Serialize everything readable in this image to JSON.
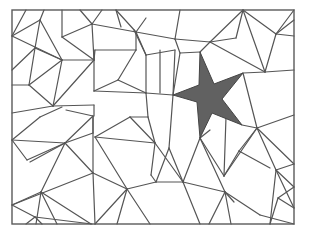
{
  "figure": {
    "title": "",
    "colors": {
      "background": "#ffffff",
      "line": "#555555",
      "star_fill": "#616161"
    },
    "frame": {
      "x": 12,
      "y": 10,
      "width": 282,
      "height": 214
    },
    "star": {
      "points": "200,52 214,84 243,73 222,99 242,125 212,113 200,138 197,102 173,95 199,85"
    },
    "edges": [
      [
        12,
        36,
        26,
        10
      ],
      [
        12,
        36,
        40,
        20
      ],
      [
        40,
        20,
        44,
        10
      ],
      [
        40,
        20,
        62,
        60
      ],
      [
        12,
        36,
        62,
        60
      ],
      [
        40,
        20,
        35,
        48
      ],
      [
        35,
        48,
        12,
        70
      ],
      [
        35,
        48,
        29,
        85
      ],
      [
        35,
        48,
        62,
        60
      ],
      [
        62,
        60,
        29,
        85
      ],
      [
        62,
        60,
        53,
        106
      ],
      [
        62,
        60,
        94,
        60
      ],
      [
        29,
        85,
        12,
        85
      ],
      [
        29,
        85,
        53,
        106
      ],
      [
        62,
        10,
        62,
        37
      ],
      [
        62,
        37,
        94,
        60
      ],
      [
        62,
        37,
        92,
        24
      ],
      [
        92,
        24,
        80,
        10
      ],
      [
        92,
        24,
        102,
        10
      ],
      [
        92,
        24,
        136,
        32
      ],
      [
        92,
        24,
        94,
        60
      ],
      [
        94,
        60,
        95,
        50
      ],
      [
        95,
        50,
        136,
        50
      ],
      [
        94,
        50,
        94,
        91
      ],
      [
        94,
        60,
        53,
        106
      ],
      [
        12,
        113,
        53,
        106
      ],
      [
        53,
        106,
        94,
        105
      ],
      [
        94,
        91,
        118,
        80
      ],
      [
        118,
        80,
        136,
        50
      ],
      [
        118,
        80,
        146,
        93
      ],
      [
        94,
        91,
        146,
        93
      ],
      [
        136,
        32,
        146,
        18
      ],
      [
        136,
        32,
        116,
        10
      ],
      [
        136,
        32,
        136,
        50
      ],
      [
        136,
        32,
        146,
        55
      ],
      [
        116,
        10,
        121,
        27
      ],
      [
        146,
        55,
        146,
        93
      ],
      [
        146,
        55,
        175,
        50
      ],
      [
        146,
        55,
        134,
        30
      ],
      [
        136,
        32,
        175,
        39
      ],
      [
        175,
        39,
        180,
        10
      ],
      [
        175,
        39,
        180,
        53
      ],
      [
        175,
        39,
        210,
        42
      ],
      [
        210,
        42,
        243,
        10
      ],
      [
        210,
        42,
        200,
        52
      ],
      [
        243,
        10,
        276,
        34
      ],
      [
        243,
        10,
        265,
        72
      ],
      [
        243,
        10,
        236,
        38
      ],
      [
        236,
        38,
        210,
        42
      ],
      [
        276,
        34,
        294,
        36
      ],
      [
        276,
        34,
        294,
        20
      ],
      [
        276,
        34,
        265,
        72
      ],
      [
        276,
        34,
        294,
        10
      ],
      [
        265,
        72,
        294,
        70
      ],
      [
        210,
        42,
        265,
        72
      ],
      [
        180,
        53,
        200,
        52
      ],
      [
        180,
        53,
        173,
        95
      ],
      [
        175,
        50,
        173,
        95
      ],
      [
        146,
        93,
        173,
        95
      ],
      [
        160,
        50,
        160,
        93
      ],
      [
        146,
        93,
        148,
        117
      ],
      [
        173,
        95,
        169,
        148
      ],
      [
        243,
        73,
        265,
        72
      ],
      [
        243,
        73,
        257,
        128
      ],
      [
        257,
        128,
        294,
        115
      ],
      [
        257,
        128,
        276,
        170
      ],
      [
        242,
        125,
        257,
        128
      ],
      [
        257,
        128,
        294,
        164
      ],
      [
        276,
        170,
        294,
        164
      ],
      [
        276,
        170,
        294,
        187
      ],
      [
        276,
        170,
        270,
        224
      ],
      [
        276,
        170,
        294,
        208
      ],
      [
        294,
        187,
        278,
        198
      ],
      [
        278,
        198,
        270,
        224
      ],
      [
        294,
        208,
        278,
        198
      ],
      [
        12,
        140,
        27,
        160
      ],
      [
        12,
        140,
        65,
        143
      ],
      [
        27,
        160,
        65,
        143
      ],
      [
        65,
        143,
        93,
        133
      ],
      [
        65,
        143,
        30,
        162
      ],
      [
        65,
        143,
        41,
        192
      ],
      [
        12,
        140,
        40,
        117
      ],
      [
        40,
        117,
        62,
        107
      ],
      [
        65,
        143,
        93,
        116
      ],
      [
        93,
        116,
        93,
        173
      ],
      [
        93,
        133,
        93,
        116
      ],
      [
        94,
        105,
        94,
        116
      ],
      [
        93,
        116,
        66,
        110
      ],
      [
        93,
        173,
        65,
        143
      ],
      [
        93,
        173,
        12,
        205
      ],
      [
        41,
        192,
        12,
        205
      ],
      [
        41,
        192,
        57,
        224
      ],
      [
        41,
        192,
        36,
        224
      ],
      [
        41,
        192,
        91,
        224
      ],
      [
        12,
        205,
        35,
        217
      ],
      [
        35,
        217,
        26,
        224
      ],
      [
        35,
        217,
        92,
        224
      ],
      [
        35,
        217,
        42,
        224
      ],
      [
        93,
        173,
        127,
        189
      ],
      [
        93,
        173,
        95,
        224
      ],
      [
        127,
        189,
        95,
        137
      ],
      [
        95,
        137,
        130,
        117
      ],
      [
        130,
        117,
        155,
        143
      ],
      [
        95,
        137,
        155,
        143
      ],
      [
        130,
        117,
        148,
        117
      ],
      [
        148,
        117,
        155,
        143
      ],
      [
        155,
        143,
        151,
        175
      ],
      [
        155,
        143,
        183,
        182
      ],
      [
        127,
        189,
        156,
        182
      ],
      [
        127,
        189,
        117,
        224
      ],
      [
        127,
        189,
        95,
        224
      ],
      [
        127,
        189,
        150,
        224
      ],
      [
        156,
        182,
        151,
        175
      ],
      [
        183,
        182,
        156,
        182
      ],
      [
        183,
        182,
        200,
        138
      ],
      [
        183,
        182,
        200,
        224
      ],
      [
        183,
        182,
        225,
        192
      ],
      [
        225,
        192,
        200,
        138
      ],
      [
        225,
        192,
        260,
        215
      ],
      [
        225,
        192,
        231,
        224
      ],
      [
        225,
        192,
        209,
        224
      ],
      [
        225,
        192,
        234,
        202
      ],
      [
        200,
        138,
        224,
        176
      ],
      [
        224,
        176,
        226,
        117
      ],
      [
        224,
        176,
        257,
        128
      ],
      [
        224,
        176,
        239,
        151
      ],
      [
        169,
        148,
        156,
        182
      ],
      [
        169,
        148,
        183,
        182
      ],
      [
        210,
        130,
        200,
        138
      ],
      [
        257,
        128,
        239,
        151
      ],
      [
        239,
        151,
        270,
        168
      ],
      [
        260,
        215,
        294,
        224
      ]
    ]
  }
}
